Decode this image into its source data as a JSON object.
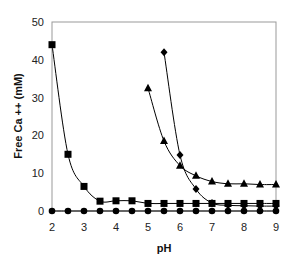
{
  "chart_data": {
    "type": "line",
    "title": "",
    "xlabel": "pH",
    "ylabel": "Free Ca ++ (mM)",
    "xlim": [
      2,
      9
    ],
    "ylim": [
      0,
      50
    ],
    "xticks": [
      2,
      3,
      4,
      5,
      6,
      7,
      8,
      9
    ],
    "yticks": [
      0,
      10,
      20,
      30,
      40,
      50
    ],
    "grid": false,
    "legend": null,
    "series": [
      {
        "name": "circles",
        "marker": "circle",
        "x": [
          2,
          2.5,
          3,
          3.5,
          4,
          4.5,
          5,
          5.5,
          6,
          6.5,
          7,
          7.5,
          8,
          8.5,
          9
        ],
        "values": [
          0,
          0,
          0,
          0,
          0,
          0,
          0,
          0,
          0,
          0,
          0,
          0,
          0,
          0,
          0
        ]
      },
      {
        "name": "squares",
        "marker": "square",
        "x": [
          2,
          2.5,
          3,
          3.5,
          4,
          4.5,
          5,
          5.5,
          6,
          6.5,
          7,
          7.5,
          8,
          8.5,
          9
        ],
        "values": [
          44,
          15,
          6.5,
          2.6,
          2.7,
          2.7,
          2,
          2,
          2,
          2,
          2,
          2,
          2,
          2,
          2
        ]
      },
      {
        "name": "diamonds",
        "marker": "diamond",
        "x": [
          5.5,
          6,
          6.5,
          7,
          7.5,
          8,
          8.5,
          9
        ],
        "values": [
          42,
          14.8,
          5.8,
          2.1,
          1.5,
          1.4,
          1.3,
          1.3
        ]
      },
      {
        "name": "triangles",
        "marker": "triangle",
        "x": [
          5,
          5.5,
          6,
          6.5,
          7,
          7.5,
          8,
          8.5,
          9
        ],
        "values": [
          32.5,
          18.5,
          12,
          9.3,
          7.8,
          7.2,
          7.2,
          7,
          7
        ]
      }
    ]
  }
}
